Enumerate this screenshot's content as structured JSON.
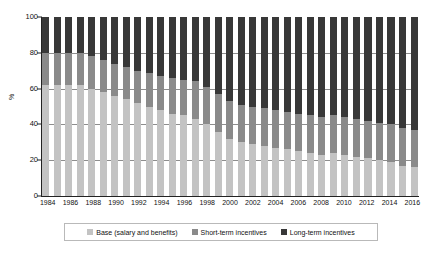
{
  "chart_data": {
    "type": "bar",
    "subtype": "stacked-100-percent",
    "title": "",
    "xlabel": "",
    "ylabel": "%",
    "ylim": [
      0,
      100
    ],
    "yticks": [
      0,
      20,
      40,
      60,
      80,
      100
    ],
    "grid": true,
    "legend_position": "bottom",
    "x_tick_labels": [
      "1984",
      "1986",
      "1988",
      "1990",
      "1992",
      "1994",
      "1996",
      "1998",
      "2000",
      "2002",
      "2004",
      "2006",
      "2008",
      "2010",
      "2012",
      "2014",
      "2016"
    ],
    "categories": [
      "1984",
      "1985",
      "1986",
      "1987",
      "1988",
      "1989",
      "1990",
      "1991",
      "1992",
      "1993",
      "1994",
      "1995",
      "1996",
      "1997",
      "1998",
      "1999",
      "2000",
      "2001",
      "2002",
      "2003",
      "2004",
      "2005",
      "2006",
      "2007",
      "2008",
      "2009",
      "2010",
      "2011",
      "2012",
      "2013",
      "2014",
      "2015",
      "2016"
    ],
    "series": [
      {
        "name": "Base (salary and benefits)",
        "color": "#c3c3c3",
        "values": [
          62,
          62,
          62,
          62,
          60,
          58,
          56,
          54,
          52,
          50,
          48,
          46,
          45,
          43,
          40,
          36,
          32,
          30,
          29,
          28,
          27,
          26,
          25,
          24,
          23,
          24,
          23,
          22,
          21,
          20,
          19,
          17,
          16
        ]
      },
      {
        "name": "Short-term incentives",
        "color": "#8a8a8a",
        "values": [
          18,
          18,
          18,
          18,
          18,
          18,
          18,
          18,
          18,
          19,
          19,
          20,
          20,
          21,
          21,
          21,
          21,
          21,
          21,
          21,
          21,
          21,
          21,
          21,
          21,
          21,
          21,
          21,
          21,
          21,
          21,
          21,
          21
        ]
      },
      {
        "name": "Long-term incentives",
        "color": "#383838",
        "values": [
          20,
          20,
          20,
          20,
          22,
          24,
          26,
          28,
          30,
          31,
          33,
          34,
          35,
          36,
          39,
          43,
          47,
          49,
          50,
          51,
          52,
          53,
          54,
          55,
          56,
          55,
          56,
          57,
          58,
          59,
          60,
          62,
          63
        ]
      }
    ]
  },
  "legend": {
    "items": [
      {
        "label": "Base (salary and benefits)",
        "color": "#c3c3c3"
      },
      {
        "label": "Short-term incentives",
        "color": "#8a8a8a"
      },
      {
        "label": "Long-term incentives",
        "color": "#383838"
      }
    ]
  }
}
